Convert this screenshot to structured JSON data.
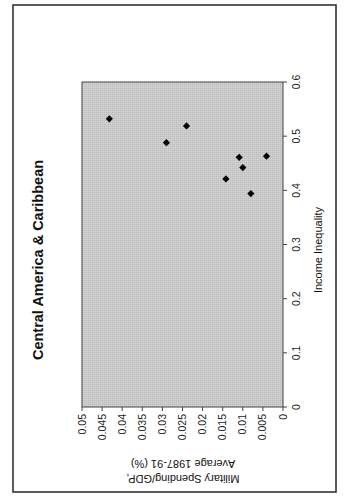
{
  "chart_data": {
    "type": "scatter",
    "title": "Central America & Caribbean",
    "xlabel": "Income Inequality",
    "ylabel_lines": [
      "Military Spending/GDP,",
      "Average 1987-91 (%)"
    ],
    "xlim": [
      0,
      0.6
    ],
    "ylim": [
      0,
      0.05
    ],
    "x_ticks": [
      "0",
      "0.1",
      "0.2",
      "0.3",
      "0.4",
      "0.5",
      "0.6"
    ],
    "y_ticks": [
      "0",
      "0.005",
      "0.01",
      "0.015",
      "0.02",
      "0.025",
      "0.03",
      "0.035",
      "0.04",
      "0.045",
      "0.05"
    ],
    "grid": false,
    "legend": null,
    "marker": "diamond",
    "rotation": "90deg counter-clockwise (page landscape)",
    "series": [
      {
        "name": "Countries",
        "points": [
          {
            "x": 0.532,
            "y": 0.0432
          },
          {
            "x": 0.519,
            "y": 0.024
          },
          {
            "x": 0.488,
            "y": 0.029
          },
          {
            "x": 0.463,
            "y": 0.0041
          },
          {
            "x": 0.461,
            "y": 0.0109
          },
          {
            "x": 0.442,
            "y": 0.01
          },
          {
            "x": 0.421,
            "y": 0.0142
          },
          {
            "x": 0.394,
            "y": 0.008
          }
        ]
      }
    ]
  },
  "colors": {
    "plot_background": "#c9c9c9",
    "marker": "#000000",
    "frame": "#333333",
    "text": "#111111"
  }
}
